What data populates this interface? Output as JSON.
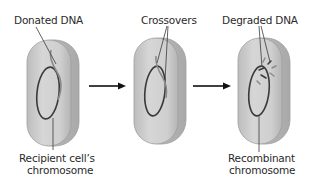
{
  "diagram": {
    "title": "",
    "colors": {
      "cell_fill": "#c9c9c9",
      "cell_highlight": "#dcdcdc",
      "cell_edge": "#9a9a9a",
      "chromosome": "#3a3a3a",
      "donated_dna": "#8a8a8a",
      "leader_line": "#3a3a3a",
      "arrow": "#111111"
    },
    "panels": [
      {
        "id": "step-1",
        "top_label": "Donated DNA",
        "bottom_label_line1": "Recipient cell’s",
        "bottom_label_line2": "chromosome"
      },
      {
        "id": "step-2",
        "top_label": "Crossovers"
      },
      {
        "id": "step-3",
        "top_label": "Degraded DNA",
        "bottom_label_line1": "Recombinant",
        "bottom_label_line2": "chromosome"
      }
    ],
    "arrows": [
      {
        "from": "step-1",
        "to": "step-2",
        "icon": "right-arrow-icon"
      },
      {
        "from": "step-2",
        "to": "step-3",
        "icon": "right-arrow-icon"
      }
    ]
  }
}
